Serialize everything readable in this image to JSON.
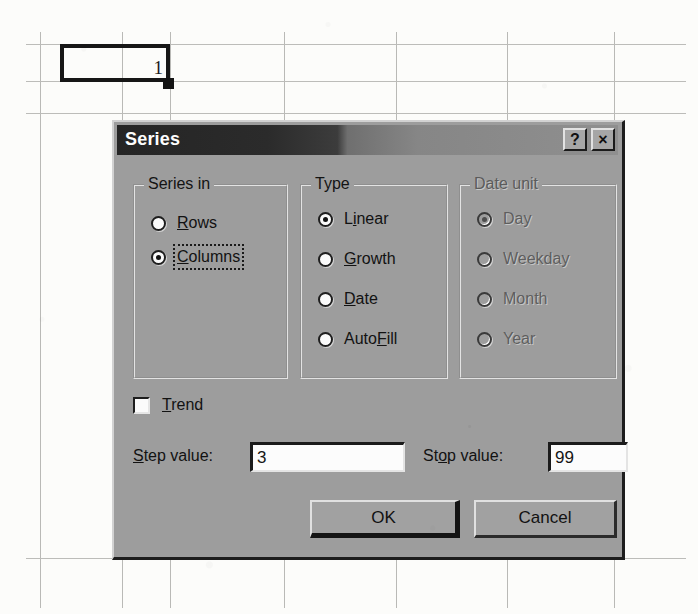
{
  "spreadsheet": {
    "selected_cell_value": "1",
    "fill_handle": "fill-handle"
  },
  "dialog": {
    "title": "Series",
    "help_button": "?",
    "close_button": "×",
    "groups": {
      "series_in": {
        "label": "Series in",
        "options": [
          {
            "label_before": "",
            "accel": "R",
            "label_after": "ows",
            "selected": false,
            "focused": false
          },
          {
            "label_before": "",
            "accel": "C",
            "label_after": "olumns",
            "selected": true,
            "focused": true
          }
        ]
      },
      "type": {
        "label": "Type",
        "options": [
          {
            "label_before": "L",
            "accel": "i",
            "label_after": "near",
            "selected": true,
            "focused": false
          },
          {
            "label_before": "",
            "accel": "G",
            "label_after": "rowth",
            "selected": false,
            "focused": false
          },
          {
            "label_before": "",
            "accel": "D",
            "label_after": "ate",
            "selected": false,
            "focused": false
          },
          {
            "label_before": "Auto",
            "accel": "F",
            "label_after": "ill",
            "selected": false,
            "focused": false
          }
        ]
      },
      "date_unit": {
        "label": "Date unit",
        "disabled": true,
        "options": [
          {
            "label_before": "",
            "accel": "D",
            "label_after": "ay",
            "selected": true
          },
          {
            "label_before": "",
            "accel": "W",
            "label_after": "eekday",
            "selected": false
          },
          {
            "label_before": "",
            "accel": "M",
            "label_after": "onth",
            "selected": false
          },
          {
            "label_before": "",
            "accel": "Y",
            "label_after": "ear",
            "selected": false
          }
        ]
      }
    },
    "trend": {
      "label_before": "",
      "accel": "T",
      "label_after": "rend",
      "checked": false
    },
    "step_value": {
      "label_before": "",
      "accel": "S",
      "label_after": "tep value:",
      "value": "3"
    },
    "stop_value": {
      "label_before": "St",
      "accel": "o",
      "label_after": "p value:",
      "value": "99"
    },
    "buttons": {
      "ok": "OK",
      "cancel": "Cancel"
    }
  },
  "colors": {
    "dialog_face": "#9d9d9d",
    "titlebar_dark": "#252525",
    "titlebar_light": "#8f8f8f",
    "text": "#121212",
    "disabled_text": "#5e5e5e",
    "field_bg": "#fcfcfc",
    "grid_line": "#b9b9b6"
  }
}
